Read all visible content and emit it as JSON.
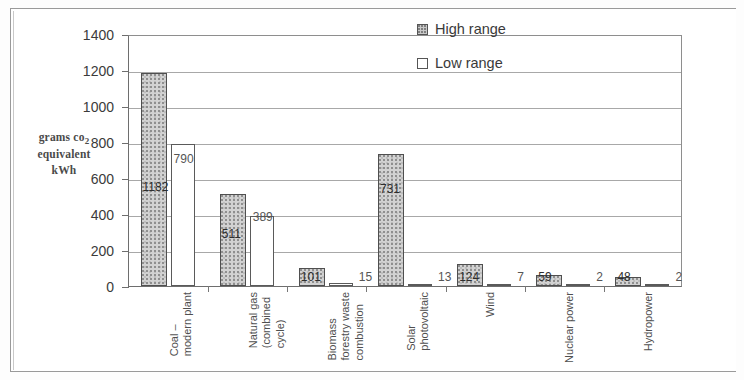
{
  "chart_data": {
    "type": "bar",
    "title": "",
    "subtitle": "",
    "xlabel": "",
    "ylabel": "grams co2 equivalent kWh",
    "ylim": [
      0,
      1400
    ],
    "ytick_step": 200,
    "yticks": [
      1400,
      1200,
      1000,
      800,
      600,
      400,
      200,
      0
    ],
    "grid": true,
    "legend_position": "top-right",
    "categories": [
      "Coal –\nmodern plant",
      "Natural gas\n(combined\ncycle)",
      "Biomass\nforestry waste\ncombustion",
      "Solar\nphotovoltaic",
      "Wind",
      "Nuclear power",
      "Hydropower"
    ],
    "series": [
      {
        "name": "High range",
        "color": "#d2d2d2",
        "values": [
          1182,
          511,
          101,
          731,
          124,
          59,
          48
        ]
      },
      {
        "name": "Low range",
        "color": "#ffffff",
        "values": [
          790,
          389,
          15,
          13,
          7,
          2,
          2
        ]
      }
    ],
    "value_labels": {
      "high": [
        "1182",
        "511",
        "101",
        "731",
        "124",
        "59",
        "48"
      ],
      "low": [
        "790",
        "389",
        "15",
        "13",
        "7",
        "2",
        "2"
      ]
    }
  },
  "axis": {
    "title_line1": "grams co",
    "title_sub": "2",
    "title_line2": "equivalent",
    "title_line3": "kWh"
  },
  "legend": {
    "items": [
      {
        "label": "High range",
        "swatch": "high-range-swatch"
      },
      {
        "label": "Low range",
        "swatch": "low-range-swatch"
      }
    ]
  },
  "colors": {
    "high_range_fill": "#d2d2d2",
    "low_range_fill": "#ffffff",
    "axis_line": "#6e6e6e",
    "gridline": "#a8a8a8",
    "text": "#3b3b3b",
    "page_background": "#ffffff"
  }
}
